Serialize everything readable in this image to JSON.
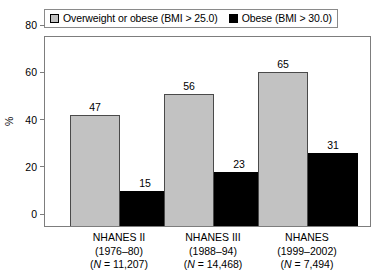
{
  "legend": {
    "entries": [
      {
        "label": "Overweight or obese (BMI > 25.0)",
        "swatch": "gray-square-swatch",
        "color": "#c2c2c2"
      },
      {
        "label": "Obese (BMI > 30.0)",
        "swatch": "black-square-swatch",
        "color": "#000000"
      }
    ]
  },
  "axes": {
    "ylabel": "%",
    "yticks": [
      "0",
      "20",
      "40",
      "60",
      "80"
    ]
  },
  "groups": [
    {
      "name": "NHANES II",
      "period": "(1976–80)",
      "n_prefix": "(",
      "n_italic": "N",
      "n_suffix": " = 11,207)",
      "n_text": "(N = 11,207)"
    },
    {
      "name": "NHANES III",
      "period": "(1988–94)",
      "n_prefix": "(",
      "n_italic": "N",
      "n_suffix": " = 14,468)",
      "n_text": "(N = 14,468)"
    },
    {
      "name": "NHANES",
      "period": "(1999–2002)",
      "n_prefix": "(",
      "n_italic": "N",
      "n_suffix": " = 7,494)",
      "n_text": "(N = 7,494)"
    }
  ],
  "bars": [
    {
      "group": 0,
      "series": 0,
      "value": 47,
      "label": "47"
    },
    {
      "group": 0,
      "series": 1,
      "value": 15,
      "label": "15"
    },
    {
      "group": 1,
      "series": 0,
      "value": 56,
      "label": "56"
    },
    {
      "group": 1,
      "series": 1,
      "value": 23,
      "label": "23"
    },
    {
      "group": 2,
      "series": 0,
      "value": 65,
      "label": "65"
    },
    {
      "group": 2,
      "series": 1,
      "value": 31,
      "label": "31"
    }
  ],
  "chart_data": {
    "type": "bar",
    "title": "",
    "xlabel": "",
    "ylabel": "%",
    "ylim": [
      0,
      80
    ],
    "yticks": [
      0,
      20,
      40,
      60,
      80
    ],
    "grid": false,
    "legend_position": "top-left",
    "categories": [
      "NHANES II (1976–80) (N = 11,207)",
      "NHANES III (1988–94) (N = 14,468)",
      "NHANES (1999–2002) (N = 7,494)"
    ],
    "series": [
      {
        "name": "Overweight or obese (BMI > 25.0)",
        "color": "#c2c2c2",
        "values": [
          47,
          56,
          65
        ]
      },
      {
        "name": "Obese (BMI > 30.0)",
        "color": "#000000",
        "values": [
          15,
          23,
          31
        ]
      }
    ],
    "sample_sizes": [
      11207,
      14468,
      7494
    ],
    "periods": [
      "1976–80",
      "1988–94",
      "1999–2002"
    ],
    "data_labels": true
  }
}
